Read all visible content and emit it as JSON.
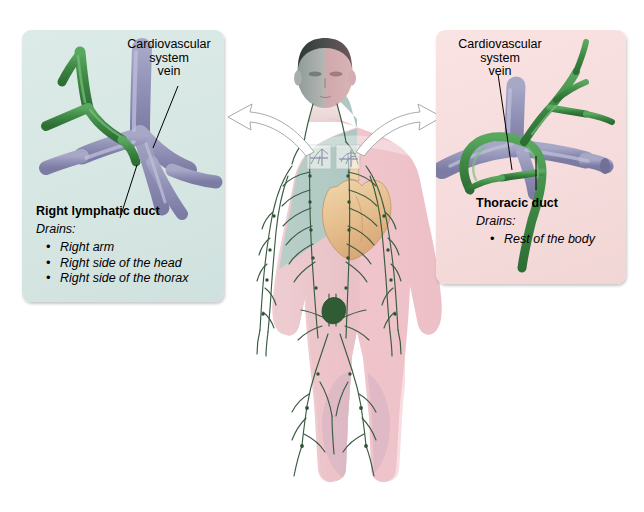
{
  "image": {
    "title": "Lymphatic drainage: right lymphatic duct and thoracic duct",
    "background_color": "#ffffff"
  },
  "panels": {
    "left": {
      "id": "right-lymphatic-duct-panel",
      "background_color": "#d8e7e4",
      "vein_label": "Cardiovascular\nsystem\nvein",
      "vein_label_lines": [
        "Cardiovascular",
        "system",
        "vein"
      ],
      "duct_title": "Right lymphatic duct",
      "drains_label": "Drains:",
      "drains_items": [
        "Right arm",
        "Right side of the head",
        "Right side of the thorax"
      ],
      "lymph_color": "#3f8a45",
      "vein_color": "#8f8fb4"
    },
    "right": {
      "id": "thoracic-duct-panel",
      "background_color": "#f6dfdf",
      "vein_label_lines": [
        "Cardiovascular",
        "system",
        "vein"
      ],
      "duct_title": "Thoracic duct",
      "drains_label": "Drains:",
      "drains_items": [
        "Rest of the body"
      ],
      "lymph_color": "#3f8a45",
      "vein_color": "#8f8fb4"
    }
  },
  "figure": {
    "name": "human-body-lymphatic-system",
    "left_half_color": "#b9cfc9",
    "right_half_color": "#f0c3c8",
    "heart_color": "#e8c79a",
    "lymph_vessel_color": "#3a5b42",
    "cisterna_chyli_color": "#2f5c34",
    "skin_highlight": "#f7e3e2"
  },
  "arrows": {
    "left": {
      "name": "arrow-to-left-panel",
      "color": "#ffffff",
      "outline": "#9aa0a4"
    },
    "right": {
      "name": "arrow-to-right-panel",
      "color": "#ffffff",
      "outline": "#9aa0a4"
    }
  }
}
